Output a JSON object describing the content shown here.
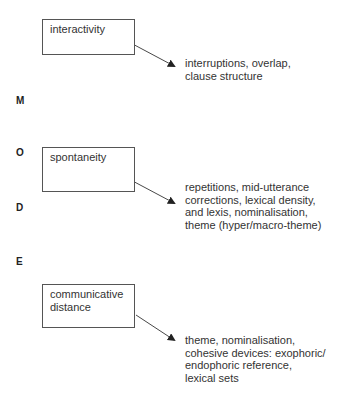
{
  "mode_label": {
    "letters": [
      "M",
      "O",
      "D",
      "E"
    ]
  },
  "dimensions": [
    {
      "label": "interactivity",
      "features": [
        "interruptions, overlap,",
        "clause structure"
      ]
    },
    {
      "label": "spontaneity",
      "features": [
        "repetitions, mid-utterance",
        "corrections, lexical density,",
        "and lexis, nominalisation,",
        "theme (hyper/macro-theme)"
      ]
    },
    {
      "label": "communicative distance",
      "label_lines": [
        "communicative",
        "distance"
      ],
      "features": [
        "theme, nominalisation,",
        "cohesive devices: exophoric/",
        "endophoric reference,",
        "lexical sets"
      ]
    }
  ],
  "colors": {
    "box_border": "#555555",
    "arrow": "#333333",
    "text": "#333333",
    "background": "#ffffff"
  }
}
